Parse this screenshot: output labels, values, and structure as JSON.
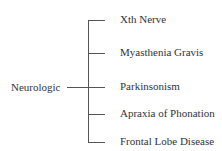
{
  "diagram": {
    "root": "Neurologic",
    "children": [
      "Xth Nerve",
      "Myasthenia Gravis",
      "Parkinsonism",
      "Apraxia of Phonation",
      "Frontal Lobe Disease"
    ]
  }
}
